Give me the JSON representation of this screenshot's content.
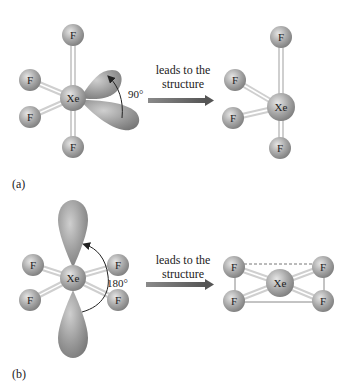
{
  "figure": {
    "panel_a": {
      "label": "(a)",
      "left_molecule": {
        "center_atom": "Xe",
        "ligands": [
          "F",
          "F",
          "F",
          "F"
        ],
        "lone_pairs": 2,
        "angle_label": "90°"
      },
      "arrow_text_line1": "leads to the",
      "arrow_text_line2": "structure",
      "right_molecule": {
        "center_atom": "Xe",
        "ligands": [
          "F",
          "F",
          "F",
          "F"
        ]
      }
    },
    "panel_b": {
      "label": "(b)",
      "left_molecule": {
        "center_atom": "Xe",
        "ligands": [
          "F",
          "F",
          "F",
          "F"
        ],
        "lone_pairs": 2,
        "angle_label": "180°"
      },
      "arrow_text_line1": "leads to the",
      "arrow_text_line2": "structure",
      "right_molecule": {
        "center_atom": "Xe",
        "ligands": [
          "F",
          "F",
          "F",
          "F"
        ]
      }
    }
  },
  "colors": {
    "atom": "#9a9a9a",
    "atom_highlight": "#e0e0e0",
    "lobe": "#8c8c8c",
    "arrow": "#6a6a6a",
    "bond": "#d8d8d8"
  }
}
